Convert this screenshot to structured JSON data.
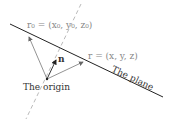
{
  "diagram": {
    "labels": {
      "r0": "r₀ = (x₀, y₀, z₀)",
      "r": "r = (x, y, z)",
      "n": "n",
      "origin": "The origin",
      "plane": "The plane"
    },
    "colors": {
      "plane_line": "#222222",
      "vectors": "#777777",
      "normal": "#333333",
      "dashed": "#bbbbbb"
    }
  }
}
